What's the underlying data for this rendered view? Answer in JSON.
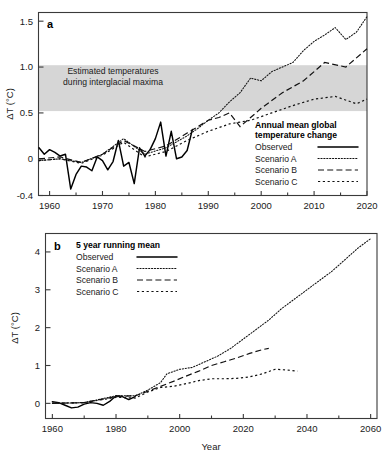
{
  "figure": {
    "background": "#ffffff",
    "ink_color": "#1a1a1a",
    "band_color": "#d6d6d6"
  },
  "panel_a": {
    "letter": "a",
    "ylabel": "ΔT (°C)",
    "yticks": [
      "1.5",
      "1.0",
      "0.5",
      "0",
      "-0.4"
    ],
    "ytick_values": [
      1.5,
      1.0,
      0.5,
      0,
      -0.4
    ],
    "xticks": [
      "1960",
      "1970",
      "1980",
      "1990",
      "2000",
      "2010",
      "2020"
    ],
    "xtick_values": [
      1960,
      1970,
      1980,
      1990,
      2000,
      2010,
      2020
    ],
    "band_label_line1": "Estimated temperatures",
    "band_label_line2": "during interglacial maxima",
    "band_range": [
      0.52,
      1.02
    ],
    "legend": {
      "title_line1": "Annual mean global",
      "title_line2": "temperature change",
      "items": [
        {
          "label": "Observed",
          "style": "solid"
        },
        {
          "label": "Scenario A",
          "style": "fine-dotted"
        },
        {
          "label": "Scenario B",
          "style": "dashed"
        },
        {
          "label": "Scenario C",
          "style": "dotted"
        }
      ]
    }
  },
  "panel_b": {
    "letter": "b",
    "ylabel": "ΔT (°C)",
    "xlabel": "Year",
    "yticks": [
      "4",
      "3",
      "2",
      "1",
      "0"
    ],
    "ytick_values": [
      4,
      3,
      2,
      1,
      0
    ],
    "xticks": [
      "1960",
      "1980",
      "2000",
      "2020",
      "2040",
      "2060"
    ],
    "xtick_values": [
      1960,
      1980,
      2000,
      2020,
      2040,
      2060
    ],
    "legend": {
      "title": "5 year running mean",
      "items": [
        {
          "label": "Observed",
          "style": "solid"
        },
        {
          "label": "Scenario A",
          "style": "fine-dotted"
        },
        {
          "label": "Scenario B",
          "style": "dashed"
        },
        {
          "label": "Scenario C",
          "style": "dotted"
        }
      ]
    }
  },
  "chart_data": [
    {
      "type": "line",
      "panel": "a",
      "title": "Annual mean global temperature change",
      "xlabel": "",
      "ylabel": "ΔT (°C)",
      "xlim": [
        1958,
        2020
      ],
      "ylim": [
        -0.4,
        1.6
      ],
      "grid": false,
      "legend_position": "lower-right",
      "annotations": [
        {
          "text": "Estimated temperatures during interglacial maxima",
          "type": "shaded-band",
          "y_range": [
            0.52,
            1.02
          ]
        }
      ],
      "series": [
        {
          "name": "Observed",
          "style": "solid",
          "x": [
            1958,
            1959,
            1960,
            1961,
            1962,
            1963,
            1964,
            1965,
            1966,
            1967,
            1968,
            1969,
            1970,
            1971,
            1972,
            1973,
            1974,
            1975,
            1976,
            1977,
            1978,
            1979,
            1980,
            1981,
            1982,
            1983,
            1984,
            1985,
            1986,
            1987
          ],
          "values": [
            0.12,
            0.05,
            0.1,
            0.07,
            0.03,
            0.05,
            -0.33,
            -0.17,
            -0.08,
            -0.09,
            -0.13,
            0.02,
            -0.02,
            -0.12,
            -0.03,
            0.2,
            -0.08,
            -0.04,
            -0.27,
            0.12,
            0.03,
            0.1,
            0.22,
            0.4,
            0.03,
            0.3,
            0.0,
            0.02,
            0.09,
            0.32
          ]
        },
        {
          "name": "Scenario A",
          "style": "fine-dotted",
          "x": [
            1958,
            1962,
            1966,
            1970,
            1974,
            1978,
            1982,
            1986,
            1988,
            1990,
            1992,
            1994,
            1996,
            1998,
            2000,
            2002,
            2004,
            2006,
            2008,
            2010,
            2012,
            2014,
            2016,
            2018,
            2020
          ],
          "values": [
            -0.02,
            0.0,
            -0.04,
            0.05,
            0.22,
            0.05,
            0.12,
            0.25,
            0.33,
            0.42,
            0.5,
            0.62,
            0.72,
            0.88,
            0.85,
            0.95,
            1.0,
            1.05,
            1.18,
            1.28,
            1.35,
            1.43,
            1.3,
            1.38,
            1.55
          ]
        },
        {
          "name": "Scenario B",
          "style": "dashed",
          "x": [
            1958,
            1962,
            1966,
            1970,
            1974,
            1978,
            1982,
            1986,
            1988,
            1990,
            1992,
            1994,
            1996,
            1998,
            2000,
            2004,
            2008,
            2012,
            2016,
            2020
          ],
          "values": [
            0.0,
            0.02,
            -0.04,
            0.05,
            0.2,
            0.08,
            0.14,
            0.28,
            0.35,
            0.42,
            0.45,
            0.5,
            0.35,
            0.45,
            0.55,
            0.72,
            0.85,
            1.05,
            1.0,
            1.2
          ]
        },
        {
          "name": "Scenario C",
          "style": "dotted",
          "x": [
            1958,
            1962,
            1966,
            1970,
            1974,
            1978,
            1982,
            1986,
            1990,
            1994,
            1998,
            2002,
            2006,
            2010,
            2014,
            2018,
            2020
          ],
          "values": [
            -0.02,
            0.0,
            -0.05,
            0.04,
            0.18,
            0.02,
            0.08,
            0.2,
            0.3,
            0.38,
            0.42,
            0.5,
            0.58,
            0.65,
            0.68,
            0.6,
            0.65
          ]
        }
      ]
    },
    {
      "type": "line",
      "panel": "b",
      "title": "5 year running mean",
      "xlabel": "Year",
      "ylabel": "ΔT (°C)",
      "xlim": [
        1958,
        2062
      ],
      "ylim": [
        -0.4,
        4.5
      ],
      "grid": false,
      "legend_position": "upper-left",
      "series": [
        {
          "name": "Observed",
          "style": "solid",
          "x": [
            1960,
            1962,
            1964,
            1966,
            1968,
            1970,
            1972,
            1974,
            1976,
            1978,
            1980,
            1982,
            1984,
            1986
          ],
          "values": [
            0.04,
            0.02,
            -0.05,
            -0.12,
            -0.1,
            -0.02,
            0.02,
            0.0,
            -0.05,
            0.05,
            0.2,
            0.18,
            0.1,
            0.18
          ]
        },
        {
          "name": "Scenario A",
          "style": "fine-dotted",
          "x": [
            1960,
            1970,
            1980,
            1986,
            1990,
            1994,
            1996,
            2000,
            2004,
            2008,
            2012,
            2016,
            2020,
            2024,
            2028,
            2032,
            2036,
            2040,
            2044,
            2048,
            2052,
            2056,
            2060
          ],
          "values": [
            0.0,
            0.02,
            0.2,
            0.2,
            0.35,
            0.55,
            0.78,
            0.9,
            0.95,
            1.1,
            1.25,
            1.45,
            1.7,
            1.95,
            2.2,
            2.5,
            2.75,
            3.0,
            3.25,
            3.5,
            3.8,
            4.1,
            4.35
          ]
        },
        {
          "name": "Scenario B",
          "style": "dashed",
          "x": [
            1960,
            1970,
            1980,
            1986,
            1990,
            1994,
            1998,
            2002,
            2006,
            2010,
            2014,
            2018,
            2022,
            2026,
            2028
          ],
          "values": [
            0.0,
            0.02,
            0.18,
            0.2,
            0.32,
            0.45,
            0.58,
            0.72,
            0.85,
            1.0,
            1.1,
            1.2,
            1.32,
            1.42,
            1.45
          ]
        },
        {
          "name": "Scenario C",
          "style": "dotted",
          "x": [
            1960,
            1970,
            1980,
            1986,
            1990,
            1994,
            1998,
            2002,
            2006,
            2010,
            2014,
            2018,
            2022,
            2026,
            2030,
            2034,
            2037
          ],
          "values": [
            0.0,
            0.02,
            0.16,
            0.14,
            0.3,
            0.42,
            0.45,
            0.52,
            0.6,
            0.65,
            0.65,
            0.66,
            0.7,
            0.78,
            0.9,
            0.88,
            0.85
          ]
        }
      ]
    }
  ]
}
